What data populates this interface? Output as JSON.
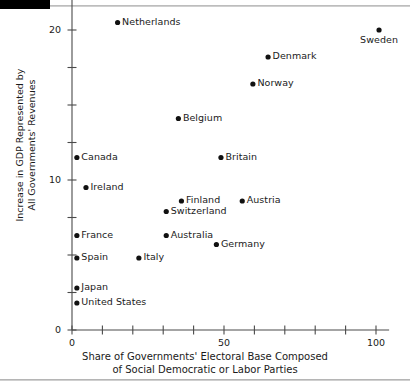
{
  "figure": {
    "decorations": {
      "top_black_bar": "black-corner-bar",
      "top_rule": "horizontal-rule",
      "bottom_rule": "horizontal-rule"
    }
  },
  "chart_data": {
    "type": "scatter",
    "title": "",
    "xlabel_line1": "Share of Governments' Electoral Base Composed",
    "xlabel_line2": "of Social Democratic or Labor Parties",
    "ylabel_line1": "Increase in GDP Represented by",
    "ylabel_line2": "All Governments' Revenues",
    "xlim": [
      0,
      103
    ],
    "ylim": [
      0,
      21.5
    ],
    "xticks": [
      0,
      10,
      20,
      30,
      40,
      50,
      60,
      70,
      80,
      90,
      100
    ],
    "xticklabels": [
      "0",
      "",
      "",
      "",
      "",
      "50",
      "",
      "",
      "",
      "",
      "100"
    ],
    "yticks": [
      0,
      2.5,
      5,
      7.5,
      10,
      12.5,
      15,
      17.5,
      20
    ],
    "yticklabels": [
      "0",
      "",
      "",
      "",
      "10",
      "",
      "",
      "",
      "20"
    ],
    "grid": false,
    "legend": "none",
    "points": [
      {
        "name": "Netherlands",
        "x": 15.0,
        "y": 20.5,
        "label_pos": "right"
      },
      {
        "name": "Sweden",
        "x": 101.0,
        "y": 20.0,
        "label_pos": "below"
      },
      {
        "name": "Denmark",
        "x": 64.5,
        "y": 18.2,
        "label_pos": "right"
      },
      {
        "name": "Norway",
        "x": 59.5,
        "y": 16.4,
        "label_pos": "right"
      },
      {
        "name": "Belgium",
        "x": 35.0,
        "y": 14.1,
        "label_pos": "right"
      },
      {
        "name": "Canada",
        "x": 1.6,
        "y": 11.5,
        "label_pos": "right"
      },
      {
        "name": "Britain",
        "x": 49.0,
        "y": 11.5,
        "label_pos": "right"
      },
      {
        "name": "Ireland",
        "x": 4.6,
        "y": 9.5,
        "label_pos": "right"
      },
      {
        "name": "Finland",
        "x": 36.0,
        "y": 8.6,
        "label_pos": "right"
      },
      {
        "name": "Austria",
        "x": 56.0,
        "y": 8.6,
        "label_pos": "right"
      },
      {
        "name": "Switzerland",
        "x": 31.0,
        "y": 7.9,
        "label_pos": "right"
      },
      {
        "name": "France",
        "x": 1.6,
        "y": 6.3,
        "label_pos": "right"
      },
      {
        "name": "Australia",
        "x": 31.0,
        "y": 6.3,
        "label_pos": "right"
      },
      {
        "name": "Germany",
        "x": 47.5,
        "y": 5.7,
        "label_pos": "right"
      },
      {
        "name": "Spain",
        "x": 1.6,
        "y": 4.8,
        "label_pos": "right"
      },
      {
        "name": "Italy",
        "x": 22.0,
        "y": 4.8,
        "label_pos": "right"
      },
      {
        "name": "Japan",
        "x": 1.6,
        "y": 2.8,
        "label_pos": "right"
      },
      {
        "name": "United States",
        "x": 1.6,
        "y": 1.8,
        "label_pos": "right"
      }
    ]
  }
}
